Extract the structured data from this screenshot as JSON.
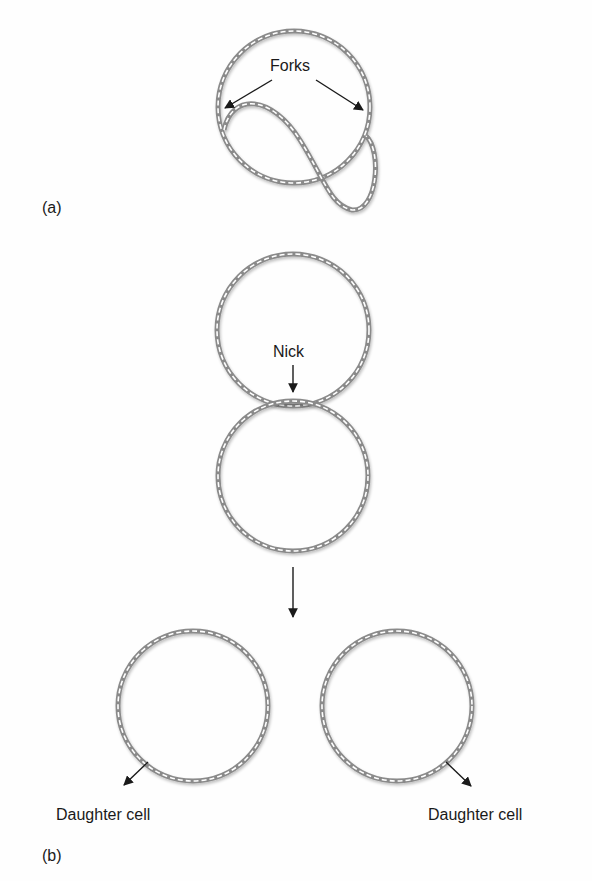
{
  "panel_a": {
    "label": "(a)",
    "forks_label": "Forks"
  },
  "panel_b": {
    "label": "(b)",
    "nick_label": "Nick",
    "daughter_left": "Daughter cell",
    "daughter_right": "Daughter cell"
  },
  "colors": {
    "dna_strand": "#8a8a8a",
    "arrow": "#1a1a1a",
    "background": "#fefefe"
  }
}
